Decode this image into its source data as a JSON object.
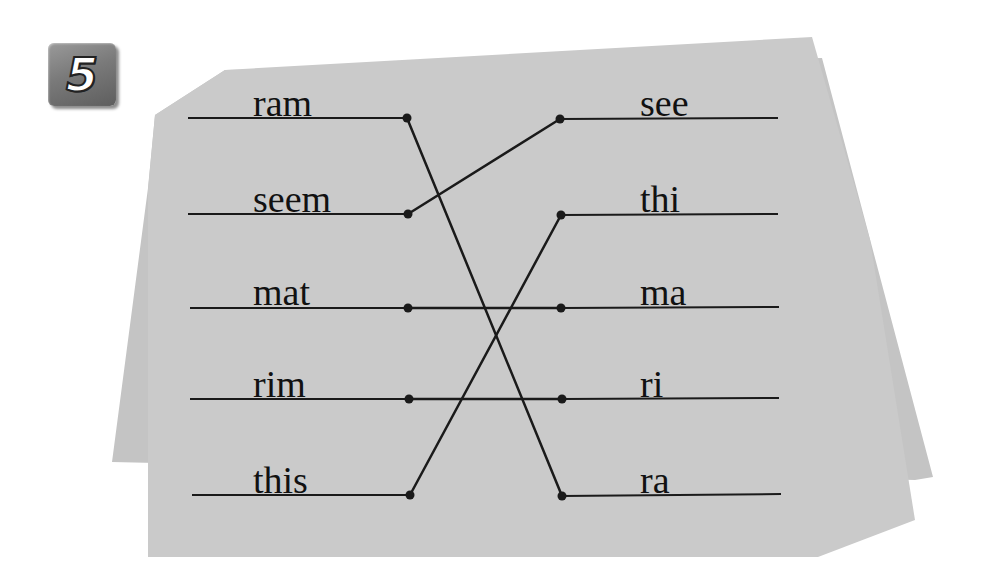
{
  "exercise": {
    "number": "5",
    "colors": {
      "paper": "#c9c9c9",
      "paper_back": "#c4c4c4",
      "ink": "#1a1a1a",
      "badge": "#7a7a7a"
    },
    "left_words": [
      {
        "text": "ram",
        "x": 253,
        "y": 84,
        "line_y": 118
      },
      {
        "text": "seem",
        "x": 253,
        "y": 180,
        "line_y": 214
      },
      {
        "text": "mat",
        "x": 253,
        "y": 273,
        "line_y": 308
      },
      {
        "text": "rim",
        "x": 253,
        "y": 365,
        "line_y": 399
      },
      {
        "text": "this",
        "x": 253,
        "y": 461,
        "line_y": 495
      }
    ],
    "right_words": [
      {
        "text": "see",
        "x": 640,
        "y": 84,
        "line_y": 119
      },
      {
        "text": "thi",
        "x": 640,
        "y": 180,
        "line_y": 215
      },
      {
        "text": "ma",
        "x": 640,
        "y": 273,
        "line_y": 308
      },
      {
        "text": "ri",
        "x": 640,
        "y": 365,
        "line_y": 399
      },
      {
        "text": "ra",
        "x": 640,
        "y": 461,
        "line_y": 496
      }
    ],
    "matches": [
      {
        "left": "ram",
        "right": "ra"
      },
      {
        "left": "seem",
        "right": "see"
      },
      {
        "left": "mat",
        "right": "ma"
      },
      {
        "left": "rim",
        "right": "ri"
      },
      {
        "left": "this",
        "right": "thi"
      }
    ]
  }
}
